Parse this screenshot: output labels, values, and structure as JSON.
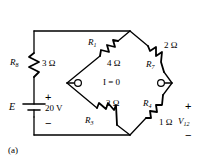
{
  "figure": {
    "caption": "(a)",
    "type": "bridge-circuit-schematic"
  },
  "source": {
    "name": "E",
    "value": "20 V",
    "plus": "+",
    "minus": "−"
  },
  "series_resistor": {
    "name": "R",
    "subscript": "8",
    "value": "3 Ω"
  },
  "bridge": {
    "arm_top_left": {
      "name": "R",
      "subscript": "1",
      "value": "4 Ω"
    },
    "arm_top_right": {
      "name": "R",
      "subscript": "7",
      "value": "2 Ω"
    },
    "arm_bottom_left": {
      "name": "R",
      "subscript": "3",
      "value": "2 Ω"
    },
    "arm_bottom_right": {
      "name": "R",
      "subscript": "4",
      "value": "1 Ω"
    },
    "galvanometer_branch": "I = 0"
  },
  "output": {
    "name": "V",
    "subscript": "12",
    "plus": "+",
    "minus": "−"
  },
  "colors": {
    "wire": "#000000",
    "background": "#ffffff"
  }
}
